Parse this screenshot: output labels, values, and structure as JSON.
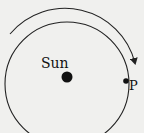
{
  "diagram": {
    "type": "orbit",
    "background": "#f0f0ee",
    "stroke_color": "#222222",
    "central_body": {
      "label": "Sun"
    },
    "orbiting_point": {
      "label": "P"
    },
    "direction": "clockwise"
  }
}
